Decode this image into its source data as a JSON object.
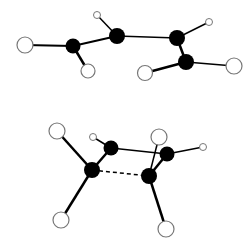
{
  "diagram": {
    "type": "molecular-structures",
    "colors": {
      "background": "#ffffff",
      "carbon": "#000000",
      "hydrogen_fill": "#ffffff",
      "hydrogen_stroke": "#777777",
      "bond": "#000000"
    },
    "molecules": [
      {
        "id": "top-molecule",
        "atoms": [
          {
            "id": "h1",
            "element": "H",
            "x": 25,
            "y": 45,
            "r": 8
          },
          {
            "id": "c1",
            "element": "C",
            "x": 73,
            "y": 46,
            "r": 7.5
          },
          {
            "id": "h2",
            "element": "H",
            "x": 88,
            "y": 71,
            "r": 7
          },
          {
            "id": "h3",
            "element": "H",
            "x": 97,
            "y": 15,
            "r": 3.5
          },
          {
            "id": "c2",
            "element": "C",
            "x": 117,
            "y": 36,
            "r": 8
          },
          {
            "id": "c3",
            "element": "C",
            "x": 177,
            "y": 38,
            "r": 8
          },
          {
            "id": "h4",
            "element": "H",
            "x": 209,
            "y": 22,
            "r": 3.5
          },
          {
            "id": "c4",
            "element": "C",
            "x": 186,
            "y": 62,
            "r": 8
          },
          {
            "id": "h5",
            "element": "H",
            "x": 145,
            "y": 73,
            "r": 7.5
          },
          {
            "id": "h6",
            "element": "H",
            "x": 234,
            "y": 66,
            "r": 8
          }
        ],
        "bonds": [
          {
            "a": "h1",
            "b": "c1",
            "style": "solid",
            "w": 2
          },
          {
            "a": "c1",
            "b": "h2",
            "style": "solid",
            "w": 2.5
          },
          {
            "a": "c1",
            "b": "c2",
            "style": "solid",
            "w": 2
          },
          {
            "a": "h3",
            "b": "c2",
            "style": "solid",
            "w": 1.5
          },
          {
            "a": "c2",
            "b": "c3",
            "style": "solid",
            "w": 1.5
          },
          {
            "a": "c3",
            "b": "h4",
            "style": "solid",
            "w": 1.5
          },
          {
            "a": "c3",
            "b": "c4",
            "style": "solid",
            "w": 2.5
          },
          {
            "a": "c4",
            "b": "h5",
            "style": "solid",
            "w": 2.5
          },
          {
            "a": "c4",
            "b": "h6",
            "style": "solid",
            "w": 1.5
          }
        ]
      },
      {
        "id": "bottom-molecule",
        "atoms": [
          {
            "id": "h7",
            "element": "H",
            "x": 57,
            "y": 131,
            "r": 8
          },
          {
            "id": "h8",
            "element": "H",
            "x": 93,
            "y": 137,
            "r": 3.5
          },
          {
            "id": "c5",
            "element": "C",
            "x": 111,
            "y": 148,
            "r": 7.5
          },
          {
            "id": "c6",
            "element": "C",
            "x": 92,
            "y": 170,
            "r": 8
          },
          {
            "id": "h9",
            "element": "H",
            "x": 159,
            "y": 137,
            "r": 8
          },
          {
            "id": "c7",
            "element": "C",
            "x": 167,
            "y": 154,
            "r": 7.5
          },
          {
            "id": "h10",
            "element": "H",
            "x": 203,
            "y": 147,
            "r": 3.5
          },
          {
            "id": "c8",
            "element": "C",
            "x": 149,
            "y": 176,
            "r": 8
          },
          {
            "id": "h11",
            "element": "H",
            "x": 61,
            "y": 220,
            "r": 8
          },
          {
            "id": "h12",
            "element": "H",
            "x": 166,
            "y": 229,
            "r": 8
          }
        ],
        "bonds": [
          {
            "a": "h7",
            "b": "c6",
            "style": "solid",
            "w": 2.5
          },
          {
            "a": "h8",
            "b": "c5",
            "style": "solid",
            "w": 1.5
          },
          {
            "a": "c5",
            "b": "c6",
            "style": "solid",
            "w": 2.5
          },
          {
            "a": "c5",
            "b": "c7",
            "style": "solid",
            "w": 1.5
          },
          {
            "a": "c6",
            "b": "c8",
            "style": "dashed",
            "w": 1.5
          },
          {
            "a": "h9",
            "b": "c8",
            "style": "solid",
            "w": 1.5
          },
          {
            "a": "c7",
            "b": "c8",
            "style": "solid",
            "w": 2.5
          },
          {
            "a": "c7",
            "b": "h10",
            "style": "solid",
            "w": 1.5
          },
          {
            "a": "c6",
            "b": "h11",
            "style": "solid",
            "w": 2.5
          },
          {
            "a": "c8",
            "b": "h12",
            "style": "solid",
            "w": 2.5
          }
        ]
      }
    ]
  }
}
